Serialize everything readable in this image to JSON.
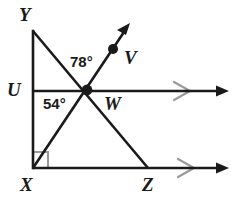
{
  "figure": {
    "background_color": "#ffffff",
    "line_color": "#1a1a1a",
    "tick_color": "#9a9a9a",
    "right_angle_color": "#9a9a9a",
    "width": 235,
    "height": 206
  },
  "points": [
    {
      "id": "Y",
      "label": "Y",
      "x": 33,
      "y": 31,
      "dot": false
    },
    {
      "id": "U",
      "label": "U",
      "x": 33,
      "y": 91,
      "dot": false
    },
    {
      "id": "X",
      "label": "X",
      "x": 33,
      "y": 168,
      "dot": false
    },
    {
      "id": "W",
      "label": "W",
      "x": 87,
      "y": 90,
      "dot": true
    },
    {
      "id": "V",
      "label": "V",
      "x": 113,
      "y": 49,
      "dot": true
    },
    {
      "id": "Z",
      "label": "Z",
      "x": 148,
      "y": 168,
      "dot": false
    }
  ],
  "angles": [
    {
      "id": "angle-78",
      "label": "78°",
      "value": 78,
      "vertex": "W",
      "between": [
        "U",
        "V"
      ]
    },
    {
      "id": "angle-54",
      "label": "54°",
      "value": 54,
      "vertex": "W",
      "between": [
        "U",
        "X"
      ]
    }
  ],
  "segments": [
    {
      "id": "segment-YX",
      "from": "Y",
      "to": "X"
    },
    {
      "id": "segment-YZ",
      "from": "Y",
      "to": "Z"
    }
  ],
  "rays": [
    {
      "id": "ray-XV",
      "from": "X",
      "through": "W",
      "arrow_at": {
        "x": 129,
        "y": 27
      }
    },
    {
      "id": "ray-UW",
      "from": "U",
      "through": "W",
      "arrow_at": {
        "x": 229,
        "y": 91
      }
    },
    {
      "id": "ray-XZ",
      "from": "X",
      "through": "Z",
      "arrow_at": {
        "x": 229,
        "y": 168
      }
    }
  ],
  "tick_marks": [
    {
      "id": "parallel-tick-upper",
      "on": "ray-UW",
      "x": 182,
      "y": 91,
      "glyph": "chevron-right"
    },
    {
      "id": "parallel-tick-lower",
      "on": "ray-XZ",
      "x": 186,
      "y": 168,
      "glyph": "chevron-right"
    }
  ],
  "right_angle": {
    "id": "right-angle-X",
    "at": "X",
    "size": 15
  }
}
